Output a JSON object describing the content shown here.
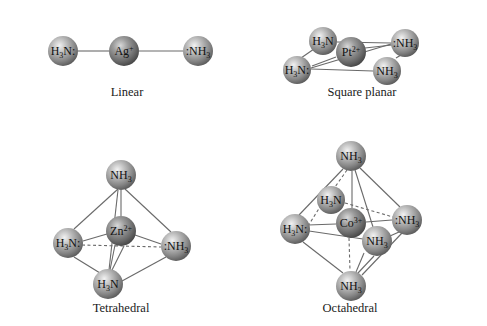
{
  "colors": {
    "background": "#ffffff",
    "bond": "#6a6a6a",
    "sphere_light": "#e6e6e6",
    "sphere_mid": "#9a9a9a",
    "sphere_dark": "#5a5a5a",
    "text": "#111111"
  },
  "geometries": [
    {
      "id": "linear",
      "caption": "Linear",
      "caption_pos": [
        127,
        96
      ],
      "atoms": [
        {
          "id": "l1",
          "label": "H",
          "sub": "3",
          "tail": "N:",
          "x": 63,
          "y": 51,
          "r": 15
        },
        {
          "id": "lc",
          "label": "Ag",
          "sup": "+",
          "x": 124,
          "y": 51,
          "r": 15
        },
        {
          "id": "l2",
          "label": ":NH",
          "sub": "3",
          "x": 198,
          "y": 51,
          "r": 15
        }
      ]
    },
    {
      "id": "square-planar",
      "caption": "Square planar",
      "caption_pos": [
        362,
        96
      ],
      "atoms": [
        {
          "id": "s1",
          "label": "H",
          "sub": "3",
          "tail": "N",
          "x": 323,
          "y": 41,
          "r": 14
        },
        {
          "id": "s2",
          "label": ":NH",
          "sub": "3",
          "x": 405,
          "y": 43,
          "r": 14
        },
        {
          "id": "sc",
          "label": "Pt",
          "sup": "2+",
          "x": 351,
          "y": 52,
          "r": 15
        },
        {
          "id": "s3",
          "label": "H",
          "sub": "3",
          "tail": "N:",
          "x": 297,
          "y": 70,
          "r": 14
        },
        {
          "id": "s4",
          "label": "NH",
          "sub": "3",
          "x": 387,
          "y": 71,
          "r": 14
        }
      ]
    },
    {
      "id": "tetrahedral",
      "caption": "Tetrahedral",
      "caption_pos": [
        121,
        312
      ],
      "atoms": [
        {
          "id": "t1",
          "label": "NH",
          "sub": "3",
          "x": 121,
          "y": 175,
          "r": 15
        },
        {
          "id": "tc",
          "label": "Zn",
          "sup": "2+",
          "x": 121,
          "y": 231,
          "r": 15
        },
        {
          "id": "t2",
          "label": "H",
          "sub": "3",
          "tail": "N:",
          "x": 68,
          "y": 243,
          "r": 15
        },
        {
          "id": "t3",
          "label": ":NH",
          "sub": "3",
          "x": 176,
          "y": 246,
          "r": 15
        },
        {
          "id": "t4",
          "label": "H",
          "sub": "3",
          "tail": "N",
          "x": 108,
          "y": 284,
          "r": 15
        }
      ]
    },
    {
      "id": "octahedral",
      "caption": "Octahedral",
      "caption_pos": [
        350,
        312
      ],
      "atoms": [
        {
          "id": "o1",
          "label": "NH",
          "sub": "3",
          "x": 351,
          "y": 156,
          "r": 15
        },
        {
          "id": "o2",
          "label": "H",
          "sub": "3",
          "tail": "N",
          "x": 331,
          "y": 200,
          "r": 14
        },
        {
          "id": "oc",
          "label": "Co",
          "sup": "3+",
          "x": 351,
          "y": 223,
          "r": 15
        },
        {
          "id": "o3",
          "label": ":NH",
          "sub": "3",
          "x": 407,
          "y": 220,
          "r": 15
        },
        {
          "id": "o4",
          "label": "H",
          "sub": "3",
          "tail": "N:",
          "x": 295,
          "y": 229,
          "r": 15
        },
        {
          "id": "o5",
          "label": "NH",
          "sub": "3",
          "x": 377,
          "y": 241,
          "r": 15
        },
        {
          "id": "o6",
          "label": "NH",
          "sub": "3",
          "x": 351,
          "y": 286,
          "r": 15
        }
      ]
    }
  ],
  "bonds": [
    {
      "from": [
        78,
        51
      ],
      "to": [
        109,
        51
      ],
      "dash": false
    },
    {
      "from": [
        139,
        51
      ],
      "to": [
        183,
        51
      ],
      "dash": false
    },
    {
      "from": [
        337,
        42
      ],
      "to": [
        391,
        43
      ],
      "dash": false
    },
    {
      "from": [
        311,
        69
      ],
      "to": [
        373,
        71
      ],
      "dash": false
    },
    {
      "from": [
        311,
        68
      ],
      "to": [
        391,
        44
      ],
      "dash": false
    },
    {
      "from": [
        301,
        58
      ],
      "to": [
        314,
        49
      ],
      "dash": false
    },
    {
      "from": [
        396,
        58
      ],
      "to": [
        401,
        55
      ],
      "dash": false
    },
    {
      "from": [
        312,
        66
      ],
      "to": [
        336,
        57
      ],
      "dash": false
    },
    {
      "from": [
        365,
        48
      ],
      "to": [
        392,
        45
      ],
      "dash": false
    },
    {
      "from": [
        118,
        189
      ],
      "to": [
        74,
        229
      ],
      "dash": false
    },
    {
      "from": [
        125,
        189
      ],
      "to": [
        171,
        232
      ],
      "dash": false
    },
    {
      "from": [
        121,
        190
      ],
      "to": [
        121,
        216
      ],
      "dash": false
    },
    {
      "from": [
        118,
        190
      ],
      "to": [
        109,
        270
      ],
      "dash": false
    },
    {
      "from": [
        83,
        241
      ],
      "to": [
        107,
        234
      ],
      "dash": false
    },
    {
      "from": [
        135,
        235
      ],
      "to": [
        161,
        244
      ],
      "dash": false
    },
    {
      "from": [
        82,
        245
      ],
      "to": [
        161,
        247
      ],
      "dash": true
    },
    {
      "from": [
        74,
        257
      ],
      "to": [
        100,
        273
      ],
      "dash": false
    },
    {
      "from": [
        122,
        281
      ],
      "to": [
        166,
        257
      ],
      "dash": false
    },
    {
      "from": [
        115,
        245
      ],
      "to": [
        110,
        270
      ],
      "dash": false
    },
    {
      "from": [
        124,
        246
      ],
      "to": [
        112,
        270
      ],
      "dash": false
    },
    {
      "from": [
        343,
        169
      ],
      "to": [
        299,
        215
      ],
      "dash": false
    },
    {
      "from": [
        360,
        168
      ],
      "to": [
        400,
        207
      ],
      "dash": false
    },
    {
      "from": [
        352,
        171
      ],
      "to": [
        352,
        208
      ],
      "dash": false
    },
    {
      "from": [
        355,
        170
      ],
      "to": [
        373,
        227
      ],
      "dash": false
    },
    {
      "from": [
        347,
        170
      ],
      "to": [
        335,
        187
      ],
      "dash": true
    },
    {
      "from": [
        308,
        225
      ],
      "to": [
        336,
        224
      ],
      "dash": false
    },
    {
      "from": [
        366,
        222
      ],
      "to": [
        392,
        220
      ],
      "dash": false
    },
    {
      "from": [
        308,
        226
      ],
      "to": [
        320,
        207
      ],
      "dash": true
    },
    {
      "from": [
        345,
        203
      ],
      "to": [
        393,
        217
      ],
      "dash": true
    },
    {
      "from": [
        309,
        231
      ],
      "to": [
        363,
        239
      ],
      "dash": false
    },
    {
      "from": [
        303,
        242
      ],
      "to": [
        343,
        273
      ],
      "dash": false
    },
    {
      "from": [
        349,
        238
      ],
      "to": [
        350,
        271
      ],
      "dash": true
    },
    {
      "from": [
        364,
        253
      ],
      "to": [
        356,
        272
      ],
      "dash": false
    },
    {
      "from": [
        399,
        232
      ],
      "to": [
        390,
        236
      ],
      "dash": false
    },
    {
      "from": [
        402,
        233
      ],
      "to": [
        362,
        275
      ],
      "dash": false
    },
    {
      "from": [
        374,
        256
      ],
      "to": [
        358,
        273
      ],
      "dash": false
    }
  ]
}
